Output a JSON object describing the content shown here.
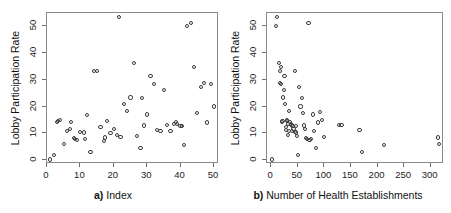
{
  "figure": {
    "background": "#ffffff",
    "point_color": "#3a3a3a",
    "frame_color": "#8a8a8a",
    "panel_count": 2
  },
  "chart_data": [
    {
      "type": "scatter",
      "panel": "a",
      "title": "",
      "xlabel": "a) Index",
      "xlabel_prefix": "a)",
      "xlabel_text": "Index",
      "ylabel": "Lobby Participation Rate",
      "xlim": [
        0,
        51.5
      ],
      "ylim": [
        -1.5,
        55
      ],
      "xticks": [
        0,
        10,
        20,
        30,
        40,
        50
      ],
      "yticks": [
        0,
        10,
        20,
        30,
        40,
        50
      ],
      "xticklabels": [
        "0",
        "10",
        "20",
        "30",
        "40",
        "50"
      ],
      "yticklabels": [
        "0",
        "10",
        "20",
        "30",
        "40",
        "50"
      ],
      "grid": false,
      "legend": null,
      "marker": "open-circle",
      "x": [
        1,
        2,
        3,
        3.3,
        4,
        5,
        6,
        7,
        7.3,
        8,
        8.4,
        9,
        10,
        11,
        11.4,
        12,
        13,
        14,
        15,
        16,
        17,
        17.4,
        18,
        19,
        20,
        21,
        21.5,
        22,
        23,
        24,
        25,
        26,
        27,
        28,
        28.5,
        29,
        30,
        31,
        32,
        33,
        34,
        35,
        36,
        37,
        38,
        38.6,
        39,
        40,
        40.5,
        41,
        42,
        43,
        44,
        45,
        46,
        47,
        48,
        49,
        50
      ],
      "y": [
        0.2,
        1.8,
        14.2,
        14.6,
        15.1,
        6.1,
        10.8,
        11.6,
        14.3,
        8.2,
        7.8,
        7.6,
        10.6,
        10.3,
        7.9,
        16.7,
        3.0,
        33.2,
        33.3,
        12.3,
        7.2,
        8.4,
        14.6,
        10.1,
        11.6,
        9.2,
        53.6,
        8.6,
        20.9,
        18.3,
        23.4,
        36.3,
        9.0,
        4.6,
        23.1,
        12.9,
        17.0,
        31.5,
        28.5,
        11.2,
        10.9,
        26.1,
        13.2,
        10.7,
        13.5,
        14.1,
        13.6,
        12.6,
        12.8,
        5.7,
        50.0,
        51.4,
        34.9,
        17.5,
        27.4,
        28.8,
        14.0,
        28.4,
        20.0
      ],
      "n_points": 59
    },
    {
      "type": "scatter",
      "panel": "b",
      "title": "",
      "xlabel": "b) Number of Health Establishments",
      "xlabel_prefix": "b)",
      "xlabel_text": "Number of Health Establishments",
      "ylabel": "Lobby Participation Rate",
      "xlim": [
        -8,
        325
      ],
      "ylim": [
        -1.5,
        55
      ],
      "xticks": [
        0,
        50,
        100,
        150,
        200,
        250,
        300
      ],
      "yticks": [
        0,
        10,
        20,
        30,
        40,
        50
      ],
      "xticklabels": [
        "0",
        "50",
        "100",
        "150",
        "200",
        "250",
        "300"
      ],
      "yticklabels": [
        "0",
        "10",
        "20",
        "30",
        "40",
        "50"
      ],
      "grid": false,
      "legend": null,
      "marker": "open-circle",
      "x": [
        2,
        9,
        11,
        14,
        16,
        17,
        18,
        19,
        20,
        21,
        22,
        24,
        25,
        26,
        27,
        28,
        29,
        30,
        31,
        32,
        33,
        34,
        36,
        37,
        38,
        39,
        40,
        42,
        44,
        45,
        46,
        47,
        48,
        50,
        52,
        55,
        58,
        60,
        62,
        64,
        66,
        68,
        70,
        72,
        75,
        78,
        80,
        84,
        88,
        92,
        96,
        100,
        128,
        132,
        166,
        170,
        212,
        314,
        316
      ],
      "y": [
        0.2,
        50.0,
        53.6,
        36.3,
        33.3,
        28.8,
        28.4,
        34.9,
        14.2,
        14.6,
        23.4,
        26.1,
        31.5,
        20.9,
        12.3,
        11.2,
        14.6,
        15.1,
        13.6,
        9.2,
        18.3,
        10.9,
        14.1,
        13.5,
        13.2,
        10.7,
        12.8,
        11.6,
        10.6,
        33.2,
        12.6,
        10.3,
        9.0,
        1.8,
        27.4,
        20.0,
        23.1,
        17.5,
        12.9,
        11.6,
        8.2,
        7.9,
        51.4,
        7.6,
        7.8,
        17.0,
        10.8,
        4.6,
        14.0,
        18.0,
        15.1,
        8.6,
        13.2,
        13.0,
        11.2,
        3.0,
        5.7,
        8.4,
        6.1
      ],
      "n_points": 59
    }
  ]
}
